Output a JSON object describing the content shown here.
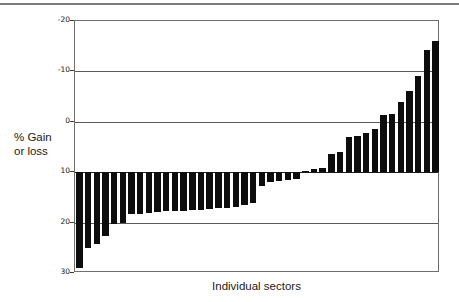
{
  "figure": {
    "top_rule_visible": true,
    "frame_color": "#6e6e6e",
    "bar_color": "#0d0d0d",
    "background": "#ffffff"
  },
  "axis": {
    "y_ticks": [
      "30",
      "20",
      "10",
      "0",
      "-10",
      "-20"
    ],
    "y_tick_values": [
      30,
      20,
      10,
      0,
      -10,
      -20
    ],
    "y_title_line1": "% Gain",
    "y_title_line2": "or loss",
    "x_title": "Individual sectors"
  },
  "chart_data": {
    "type": "bar",
    "title": "",
    "subtitle": "",
    "xlabel": "Individual sectors",
    "ylabel": "% Gain or loss",
    "ylim": [
      -20,
      30
    ],
    "yticks": [
      -20,
      -10,
      0,
      10,
      20,
      30
    ],
    "grid": true,
    "gridlines_horizontal": [
      30,
      20,
      10,
      0,
      -10,
      -20
    ],
    "legend": null,
    "legend_position": "none",
    "orientation": "vertical",
    "sorted": "ascending",
    "bar_color": "#0d0d0d",
    "categories": [
      "s1",
      "s2",
      "s3",
      "s4",
      "s5",
      "s6",
      "s7",
      "s8",
      "s9",
      "s10",
      "s11",
      "s12",
      "s13",
      "s14",
      "s15",
      "s16",
      "s17",
      "s18",
      "s19",
      "s20",
      "s21",
      "s22",
      "s23",
      "s24",
      "s25",
      "s26",
      "s27",
      "s28",
      "s29",
      "s30",
      "s31",
      "s32",
      "s33",
      "s34",
      "s35",
      "s36",
      "s37",
      "s38",
      "s39",
      "s40",
      "s41",
      "s42"
    ],
    "category_labels_shown": false,
    "values": [
      -19.0,
      -15.1,
      -14.2,
      -12.6,
      -10.2,
      -10.1,
      -8.3,
      -8.2,
      -8.1,
      -7.9,
      -7.8,
      -7.8,
      -7.7,
      -7.4,
      -7.2,
      -7.2,
      -6.1,
      -2.8,
      -2.0,
      -1.7,
      -1.6,
      -1.3,
      0.2,
      0.7,
      0.9,
      3.7,
      4.1,
      6.9,
      7.1,
      7.7,
      8.5,
      11.3,
      11.5,
      13.9,
      16.1,
      19.0,
      24.2,
      26.1,
      -7.5,
      -7.6,
      -7.0,
      -6.5
    ],
    "values_plot_order": [
      -19.0,
      -15.1,
      -14.2,
      -12.6,
      -10.2,
      -10.1,
      -8.3,
      -8.2,
      -8.1,
      -7.9,
      -7.8,
      -7.8,
      -7.7,
      -7.6,
      -7.5,
      -7.4,
      -7.2,
      -7.2,
      -7.0,
      -6.5,
      -6.1,
      -2.8,
      -2.0,
      -1.7,
      -1.6,
      -1.3,
      0.2,
      0.7,
      0.9,
      3.7,
      4.1,
      6.9,
      7.1,
      7.7,
      8.5,
      11.3,
      11.5,
      13.9,
      16.1,
      19.0,
      24.2,
      26.1
    ],
    "bar_count": 42,
    "min_value": -19.0,
    "max_value": 26.1
  }
}
